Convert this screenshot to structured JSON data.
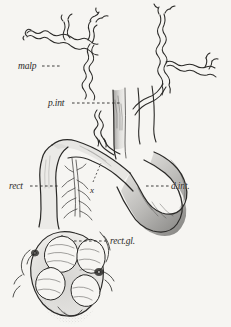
{
  "figure": {
    "domain": "scientific-anatomical-line-drawing",
    "background_color": "#f6f5f2",
    "ink_color": "#2b2a28",
    "labels": [
      {
        "id": "malp",
        "text": "malp",
        "x": 18,
        "y": 62,
        "leader": "dashes-right"
      },
      {
        "id": "pint",
        "text": "p.int",
        "x": 48,
        "y": 99,
        "leader": "dashes-right"
      },
      {
        "id": "rect",
        "text": "rect",
        "x": 9,
        "y": 182,
        "leader": "dashes-right"
      },
      {
        "id": "dint",
        "text": "d.int.",
        "x": 171,
        "y": 182,
        "leader": "dashes-left"
      },
      {
        "id": "rectgl",
        "text": "rect.gl.",
        "x": 110,
        "y": 237,
        "leader": "dashes-left"
      },
      {
        "id": "x",
        "text": "x",
        "x": 90,
        "y": 186,
        "leader": "dotted-up-right"
      }
    ],
    "structures": [
      {
        "name": "malpighian-tubules-left",
        "description": "slender wavy branching tubule, upper left"
      },
      {
        "name": "malpighian-tubules-right",
        "description": "slender wavy branching tubule, upper right"
      },
      {
        "name": "proximal-intestine",
        "description": "narrow convoluted tube below tubule junction"
      },
      {
        "name": "distal-intestine",
        "description": "thick shaded loop curving to lower right"
      },
      {
        "name": "rectum",
        "description": "broad tube descending on left"
      },
      {
        "name": "rectal-gland-mass",
        "description": "bulbous stippled sac at bottom with lobed glands"
      }
    ]
  }
}
